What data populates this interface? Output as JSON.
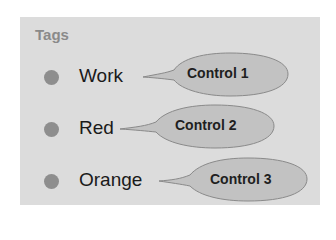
{
  "tags": {
    "title": "Tags",
    "items": [
      {
        "label": "Work",
        "dot_color": "#8e8e8e"
      },
      {
        "label": "Red",
        "dot_color": "#8e8e8e"
      },
      {
        "label": "Orange",
        "dot_color": "#8e8e8e"
      }
    ]
  },
  "callouts": [
    {
      "label": "Control 1"
    },
    {
      "label": "Control 2"
    },
    {
      "label": "Control 3"
    }
  ],
  "colors": {
    "panel_bg": "#dcdcdc",
    "callout_fill": "#c2c2c2",
    "callout_stroke": "#8a8a8a"
  }
}
